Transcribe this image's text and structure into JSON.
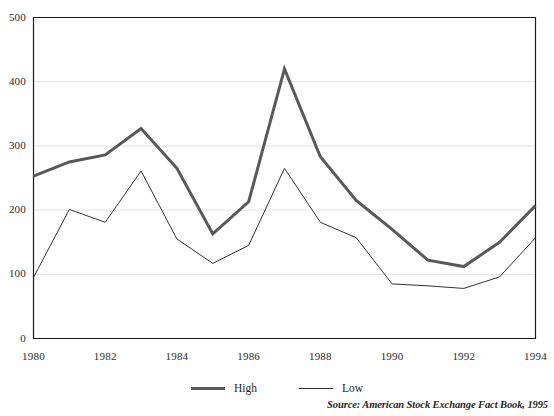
{
  "chart_data": {
    "type": "line",
    "title": "",
    "xlabel": "",
    "ylabel": "",
    "x": [
      1980,
      1981,
      1982,
      1983,
      1984,
      1985,
      1986,
      1987,
      1988,
      1989,
      1990,
      1991,
      1992,
      1993,
      1994
    ],
    "categories": [
      "1980",
      "1981",
      "1982",
      "1983",
      "1984",
      "1985",
      "1986",
      "1987",
      "1988",
      "1989",
      "1990",
      "1991",
      "1992",
      "1993",
      "1994"
    ],
    "series": [
      {
        "name": "High",
        "color": "#595959",
        "line_width": 3,
        "values": [
          253,
          275,
          286,
          327,
          265,
          163,
          213,
          420,
          283,
          215,
          170,
          122,
          112,
          150,
          207
        ]
      },
      {
        "name": "Low",
        "color": "#333333",
        "line_width": 1,
        "values": [
          95,
          201,
          181,
          261,
          155,
          117,
          145,
          265,
          181,
          157,
          85,
          82,
          78,
          96,
          157
        ]
      }
    ],
    "ylim": [
      0,
      500
    ],
    "yticks": [
      0,
      100,
      200,
      300,
      400,
      500
    ],
    "ytick_labels": [
      "0",
      "100",
      "200",
      "300",
      "400",
      "500"
    ],
    "xtick_labels": [
      "1980",
      "1982",
      "1984",
      "1986",
      "1988",
      "1990",
      "1992",
      "1994"
    ],
    "xticks": [
      1980,
      1982,
      1984,
      1986,
      1988,
      1990,
      1992,
      1994
    ],
    "xlim": [
      1980,
      1994
    ],
    "grid": "horizontal",
    "grid_color": "#e3e3e3",
    "axis_color": "#1a1a1a",
    "legend_position": "bottom-center",
    "legend_entries": [
      "High",
      "Low"
    ],
    "source": "Source: American Stock Exchange Fact Book, 1995"
  }
}
